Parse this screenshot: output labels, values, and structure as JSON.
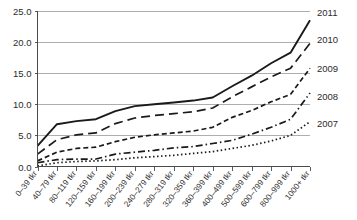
{
  "chart_data": {
    "type": "line",
    "title": "",
    "subtitle": "",
    "xlabel": "",
    "ylabel": "",
    "grid": true,
    "legend_position": "right",
    "ylim": [
      0.0,
      25.0
    ],
    "yticks": [
      "0.0",
      "5.0",
      "10.0",
      "15.0",
      "20.0",
      "25.0"
    ],
    "ytick_values": [
      0.0,
      5.0,
      10.0,
      15.0,
      20.0,
      25.0
    ],
    "categories": [
      "0–39 tkr",
      "40–79 tkr",
      "80–119 tkr",
      "120–159 tkr",
      "160–199 tkr",
      "200–239 tkr",
      "240–279 tkr",
      "280–319 tkr",
      "320–359 tkr",
      "360–399 tkr",
      "400–499 tkr",
      "500–599 tkr",
      "600–799 tkr",
      "800–999 tkr",
      "1000+ tkr"
    ],
    "series": [
      {
        "name": "2011",
        "style": "solid",
        "dash": "none",
        "values": [
          3.3,
          6.8,
          7.3,
          7.6,
          8.9,
          9.7,
          10.0,
          10.3,
          10.6,
          11.1,
          12.9,
          14.6,
          16.6,
          18.3,
          23.5
        ]
      },
      {
        "name": "2010",
        "style": "dashed",
        "dash": "9 5",
        "values": [
          2.0,
          4.3,
          5.1,
          5.4,
          6.9,
          7.8,
          8.2,
          8.5,
          8.8,
          9.4,
          11.2,
          12.8,
          14.4,
          15.8,
          19.8
        ]
      },
      {
        "name": "2009",
        "style": "short-dashed",
        "dash": "5 3",
        "values": [
          0.9,
          2.3,
          2.9,
          3.1,
          4.0,
          4.7,
          5.1,
          5.4,
          5.7,
          6.3,
          7.9,
          9.0,
          10.4,
          11.6,
          15.8
        ]
      },
      {
        "name": "2008",
        "style": "dash-dot",
        "dash": "7 3 1.5 3",
        "values": [
          0.6,
          1.1,
          1.2,
          1.2,
          2.0,
          2.3,
          2.6,
          3.0,
          3.2,
          3.7,
          4.2,
          5.2,
          6.3,
          7.6,
          11.8
        ]
      },
      {
        "name": "2007",
        "style": "dotted",
        "dash": "1.5 2.5",
        "values": [
          0.1,
          0.6,
          0.8,
          0.9,
          1.1,
          1.4,
          1.6,
          1.8,
          2.1,
          2.4,
          2.9,
          3.4,
          4.1,
          5.0,
          7.2
        ]
      }
    ],
    "series_labels": [
      "2011",
      "2010",
      "2009",
      "2008",
      "2007"
    ],
    "colors": {
      "line": "#1a1a1a",
      "grid": "#9a9a9a",
      "axis": "#4a4a4a",
      "text": "#2b2b2b",
      "background": "#ffffff"
    }
  },
  "legend": {
    "items": [
      {
        "label": "2011"
      },
      {
        "label": "2010"
      },
      {
        "label": "2009"
      },
      {
        "label": "2008"
      },
      {
        "label": "2007"
      }
    ]
  }
}
